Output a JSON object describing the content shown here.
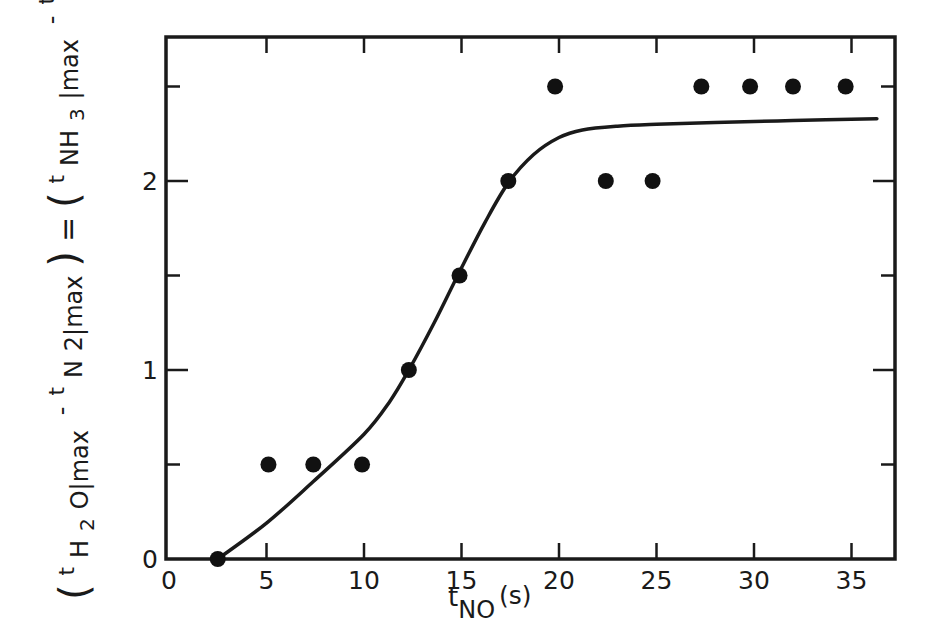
{
  "chart_data": {
    "type": "scatter",
    "title": "",
    "xlabel": "t_NO (s)",
    "ylabel": "(t_H2O|max - t_N2|max) = (t_NH3|max - t_N2|max) (s)",
    "xlim": [
      0,
      37
    ],
    "ylim": [
      0,
      2.8
    ],
    "grid": false,
    "legend": null,
    "x_ticks": [
      0,
      5,
      10,
      15,
      20,
      25,
      30,
      35
    ],
    "x_tick_labels": [
      "0",
      "5",
      "10",
      "15",
      "20",
      "25",
      "30",
      "35"
    ],
    "y_ticks_major": [
      0,
      1,
      2
    ],
    "y_tick_labels": [
      "0",
      "1",
      "2"
    ],
    "y_ticks_minor": [
      0.5,
      1.5,
      2.5
    ],
    "series": [
      {
        "name": "measured",
        "kind": "scatter",
        "marker": "filled-circle",
        "x": [
          2.5,
          5.1,
          7.4,
          9.9,
          12.3,
          14.9,
          17.4,
          19.8,
          22.4,
          24.8,
          27.3,
          29.8,
          32.0,
          34.7
        ],
        "y": [
          0.0,
          0.5,
          0.5,
          0.5,
          1.0,
          1.5,
          2.0,
          2.5,
          2.0,
          2.0,
          2.5,
          2.5,
          2.5,
          2.5
        ]
      },
      {
        "name": "fit",
        "kind": "line",
        "x": [
          2.5,
          5.0,
          7.4,
          10.0,
          11.3,
          12.3,
          13.6,
          14.9,
          16.2,
          17.4,
          18.7,
          20.0,
          21.2,
          23.0,
          25.0,
          28.0,
          32.0,
          36.3
        ],
        "y": [
          0.0,
          0.19,
          0.41,
          0.66,
          0.83,
          1.0,
          1.25,
          1.52,
          1.78,
          1.99,
          2.14,
          2.23,
          2.27,
          2.29,
          2.3,
          2.31,
          2.32,
          2.33
        ]
      }
    ]
  },
  "axes": {
    "x_label_main": "t",
    "x_label_sub": "NO",
    "x_label_unit": "(s)",
    "y_label_parts": {
      "open1": "(",
      "t1": "t",
      "sub1": "H",
      "sub1b": "2",
      "sub1c": "O|max",
      "minus1": "-",
      "t2": "t",
      "sub2": "N",
      "sub2b": "2|max",
      "close1": ")",
      "equals": "=",
      "open2": "(",
      "t3": "t",
      "sub3": "NH",
      "sub3b": "3",
      "sub3c": "|max",
      "minus2": "-",
      "t4": "t",
      "sub4": "N",
      "sub4b": "2|max",
      "close2": ")",
      "unit": "(s)"
    }
  }
}
